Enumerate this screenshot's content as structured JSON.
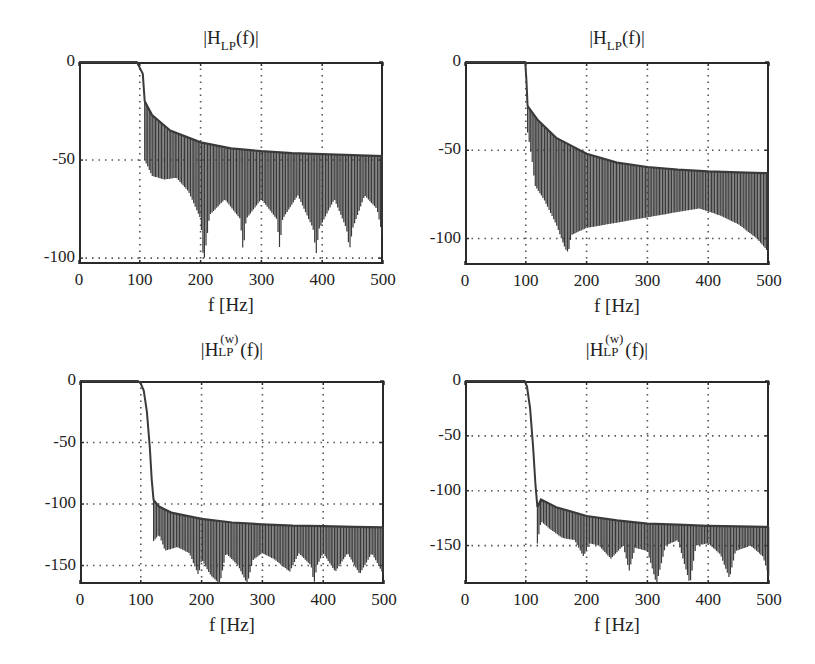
{
  "chart_data": [
    {
      "id": "tl",
      "type": "line",
      "title": "|H_LP(f)|",
      "title_parts": {
        "pre": "|H",
        "sub": "LP",
        "sup": "",
        "post": "(f)|"
      },
      "xlabel": "f [Hz]",
      "ylabel": "",
      "xlim": [
        0,
        500
      ],
      "ylim": [
        -103,
        0
      ],
      "xticks": [
        0,
        100,
        200,
        300,
        400,
        500
      ],
      "yticks": [
        0,
        -50,
        -100
      ],
      "grid": true,
      "box": {
        "left": 79,
        "top": 62,
        "right": 383,
        "bottom": 264
      },
      "passband_edge_hz": 100,
      "transition": [
        [
          0,
          0
        ],
        [
          95,
          0
        ],
        [
          100,
          -3
        ],
        [
          105,
          -6
        ],
        [
          108,
          -20
        ]
      ],
      "upper_envelope": [
        [
          108,
          -20
        ],
        [
          120,
          -27
        ],
        [
          150,
          -35
        ],
        [
          200,
          -41
        ],
        [
          250,
          -44
        ],
        [
          300,
          -45.5
        ],
        [
          350,
          -46.5
        ],
        [
          400,
          -47
        ],
        [
          450,
          -47.5
        ],
        [
          500,
          -48
        ]
      ],
      "lower_envelope": [
        [
          108,
          -50
        ],
        [
          120,
          -58
        ],
        [
          140,
          -60
        ],
        [
          160,
          -59
        ],
        [
          180,
          -66
        ],
        [
          200,
          -80
        ],
        [
          205,
          -103
        ],
        [
          215,
          -78
        ],
        [
          240,
          -70
        ],
        [
          265,
          -80
        ],
        [
          270,
          -97
        ],
        [
          275,
          -80
        ],
        [
          300,
          -70
        ],
        [
          325,
          -80
        ],
        [
          330,
          -95
        ],
        [
          335,
          -80
        ],
        [
          360,
          -68
        ],
        [
          385,
          -85
        ],
        [
          390,
          -98
        ],
        [
          395,
          -85
        ],
        [
          420,
          -70
        ],
        [
          440,
          -85
        ],
        [
          445,
          -96
        ],
        [
          450,
          -85
        ],
        [
          470,
          -68
        ],
        [
          490,
          -75
        ],
        [
          500,
          -90
        ]
      ]
    },
    {
      "id": "tr",
      "type": "line",
      "title": "|H_LP(f)|",
      "title_parts": {
        "pre": "|H",
        "sub": "LP",
        "sup": "",
        "post": "(f)|"
      },
      "xlabel": "f [Hz]",
      "ylabel": "",
      "xlim": [
        0,
        500
      ],
      "ylim": [
        -115,
        0
      ],
      "xticks": [
        0,
        100,
        200,
        300,
        400,
        500
      ],
      "yticks": [
        0,
        -50,
        -100
      ],
      "grid": true,
      "box": {
        "left": 465,
        "top": 62,
        "right": 769,
        "bottom": 265
      },
      "passband_edge_hz": 100,
      "transition": [
        [
          0,
          0
        ],
        [
          99,
          0
        ],
        [
          101,
          -10
        ],
        [
          103,
          -25
        ]
      ],
      "upper_envelope": [
        [
          103,
          -25
        ],
        [
          120,
          -33
        ],
        [
          150,
          -43
        ],
        [
          200,
          -52
        ],
        [
          250,
          -57
        ],
        [
          300,
          -59.5
        ],
        [
          350,
          -61
        ],
        [
          400,
          -62
        ],
        [
          450,
          -62.5
        ],
        [
          500,
          -63
        ]
      ],
      "lower_envelope": [
        [
          103,
          -40
        ],
        [
          110,
          -55
        ],
        [
          115,
          -70
        ],
        [
          130,
          -78
        ],
        [
          150,
          -92
        ],
        [
          165,
          -106
        ],
        [
          170,
          -108
        ],
        [
          175,
          -98
        ],
        [
          200,
          -94
        ],
        [
          250,
          -91
        ],
        [
          300,
          -88
        ],
        [
          350,
          -85
        ],
        [
          385,
          -83
        ],
        [
          420,
          -87
        ],
        [
          450,
          -92
        ],
        [
          480,
          -100
        ],
        [
          500,
          -108
        ]
      ]
    },
    {
      "id": "bl",
      "type": "line",
      "title": "|H_LP^(w)(f)|",
      "title_parts": {
        "pre": "|H",
        "sub": "LP",
        "sup": "(w)",
        "post": "(f)|"
      },
      "xlabel": "f [Hz]",
      "ylabel": "",
      "xlim": [
        0,
        500
      ],
      "ylim": [
        -165,
        0
      ],
      "xticks": [
        0,
        100,
        200,
        300,
        400,
        500
      ],
      "yticks": [
        0,
        -50,
        -100,
        -150
      ],
      "grid": true,
      "box": {
        "left": 80,
        "top": 381,
        "right": 384,
        "bottom": 584
      },
      "passband_edge_hz": 100,
      "transition": [
        [
          0,
          0
        ],
        [
          95,
          0
        ],
        [
          100,
          -2
        ],
        [
          105,
          -8
        ],
        [
          110,
          -25
        ],
        [
          115,
          -55
        ],
        [
          118,
          -80
        ],
        [
          121,
          -97
        ]
      ],
      "upper_envelope": [
        [
          121,
          -97
        ],
        [
          130,
          -102
        ],
        [
          150,
          -107
        ],
        [
          200,
          -112
        ],
        [
          250,
          -115
        ],
        [
          300,
          -116.5
        ],
        [
          350,
          -117.5
        ],
        [
          400,
          -118
        ],
        [
          450,
          -118.5
        ],
        [
          500,
          -119
        ]
      ],
      "lower_envelope": [
        [
          121,
          -130
        ],
        [
          130,
          -125
        ],
        [
          140,
          -138
        ],
        [
          160,
          -135
        ],
        [
          180,
          -140
        ],
        [
          195,
          -158
        ],
        [
          200,
          -145
        ],
        [
          215,
          -158
        ],
        [
          230,
          -165
        ],
        [
          240,
          -140
        ],
        [
          260,
          -150
        ],
        [
          275,
          -165
        ],
        [
          285,
          -145
        ],
        [
          300,
          -140
        ],
        [
          320,
          -145
        ],
        [
          345,
          -155
        ],
        [
          360,
          -140
        ],
        [
          380,
          -150
        ],
        [
          385,
          -165
        ],
        [
          390,
          -150
        ],
        [
          400,
          -140
        ],
        [
          420,
          -155
        ],
        [
          440,
          -140
        ],
        [
          460,
          -157
        ],
        [
          480,
          -140
        ],
        [
          500,
          -158
        ]
      ]
    },
    {
      "id": "br",
      "type": "line",
      "title": "|H_LP^(w)(f)|",
      "title_parts": {
        "pre": "|H",
        "sub": "LP",
        "sup": "(w)",
        "post": "(f)|"
      },
      "xlabel": "f [Hz]",
      "ylabel": "",
      "xlim": [
        0,
        500
      ],
      "ylim": [
        -185,
        0
      ],
      "xticks": [
        0,
        100,
        200,
        300,
        400,
        500
      ],
      "yticks": [
        0,
        -50,
        -100,
        -150
      ],
      "grid": true,
      "box": {
        "left": 465,
        "top": 381,
        "right": 769,
        "bottom": 584
      },
      "passband_edge_hz": 100,
      "transition": [
        [
          0,
          0
        ],
        [
          98,
          0
        ],
        [
          102,
          -5
        ],
        [
          107,
          -25
        ],
        [
          112,
          -60
        ],
        [
          116,
          -95
        ],
        [
          119,
          -115
        ]
      ],
      "upper_envelope": [
        [
          119,
          -115
        ],
        [
          125,
          -108
        ],
        [
          150,
          -115
        ],
        [
          200,
          -123
        ],
        [
          250,
          -127
        ],
        [
          300,
          -130
        ],
        [
          350,
          -131
        ],
        [
          400,
          -132
        ],
        [
          450,
          -132.5
        ],
        [
          500,
          -133
        ]
      ],
      "lower_envelope": [
        [
          119,
          -148
        ],
        [
          125,
          -128
        ],
        [
          140,
          -135
        ],
        [
          160,
          -143
        ],
        [
          180,
          -145
        ],
        [
          195,
          -160
        ],
        [
          205,
          -148
        ],
        [
          220,
          -150
        ],
        [
          240,
          -162
        ],
        [
          260,
          -150
        ],
        [
          270,
          -173
        ],
        [
          280,
          -152
        ],
        [
          300,
          -155
        ],
        [
          315,
          -185
        ],
        [
          330,
          -150
        ],
        [
          350,
          -145
        ],
        [
          370,
          -185
        ],
        [
          380,
          -150
        ],
        [
          400,
          -148
        ],
        [
          420,
          -158
        ],
        [
          435,
          -180
        ],
        [
          445,
          -155
        ],
        [
          470,
          -150
        ],
        [
          490,
          -160
        ],
        [
          500,
          -178
        ]
      ]
    }
  ],
  "style": {
    "line_color": "#3a3a3a",
    "grid_color": "#555555",
    "axis_color": "#2a2a2a",
    "ripple_spacing_hz": 4.2
  }
}
